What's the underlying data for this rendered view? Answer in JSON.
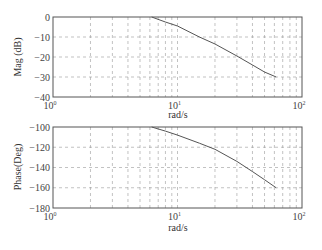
{
  "chart_data": [
    {
      "type": "line",
      "title": "",
      "xlabel": "rad/s",
      "ylabel": "Mag (dB)",
      "xscale": "log",
      "xlim": [
        1,
        100
      ],
      "ylim": [
        -40,
        0
      ],
      "xticks": [
        "10^0",
        "10^1",
        "10^2"
      ],
      "yticks": [
        0,
        -10,
        -20,
        -30,
        -40
      ],
      "grid": true,
      "series": [
        {
          "name": "Magnitude",
          "x": [
            6.2,
            8,
            10,
            15,
            20,
            30,
            40,
            50,
            62
          ],
          "y": [
            0,
            -2.5,
            -4.5,
            -10,
            -13.5,
            -19.5,
            -24,
            -27.5,
            -30
          ]
        }
      ]
    },
    {
      "type": "line",
      "title": "",
      "xlabel": "rad/s",
      "ylabel": "Phase(Deg)",
      "xscale": "log",
      "xlim": [
        1,
        100
      ],
      "ylim": [
        -180,
        -100
      ],
      "xticks": [
        "10^0",
        "10^1",
        "10^2"
      ],
      "yticks": [
        -100,
        -120,
        -140,
        -160,
        -180
      ],
      "grid": true,
      "series": [
        {
          "name": "Phase",
          "x": [
            6.2,
            8,
            10,
            15,
            20,
            30,
            40,
            50,
            62
          ],
          "y": [
            -100,
            -104,
            -108,
            -116,
            -122,
            -134,
            -144,
            -152,
            -160
          ]
        }
      ]
    }
  ],
  "plots": {
    "magnitude": {
      "ylabel": "Mag (dB)",
      "xlabel": "rad/s",
      "yticks": [
        "0",
        "−10",
        "−20",
        "−30",
        "−40"
      ],
      "xticks": [
        {
          "base": "10",
          "exp": "0"
        },
        {
          "base": "10",
          "exp": "1"
        },
        {
          "base": "10",
          "exp": "2"
        }
      ]
    },
    "phase": {
      "ylabel": "Phase(Deg)",
      "xlabel": "rad/s",
      "yticks": [
        "−100",
        "−120",
        "−140",
        "−160",
        "−180"
      ],
      "xticks": [
        {
          "base": "10",
          "exp": "0"
        },
        {
          "base": "10",
          "exp": "1"
        },
        {
          "base": "10",
          "exp": "2"
        }
      ]
    }
  },
  "colors": {
    "axis": "#555555",
    "grid": "#999999",
    "curve": "#555555"
  }
}
